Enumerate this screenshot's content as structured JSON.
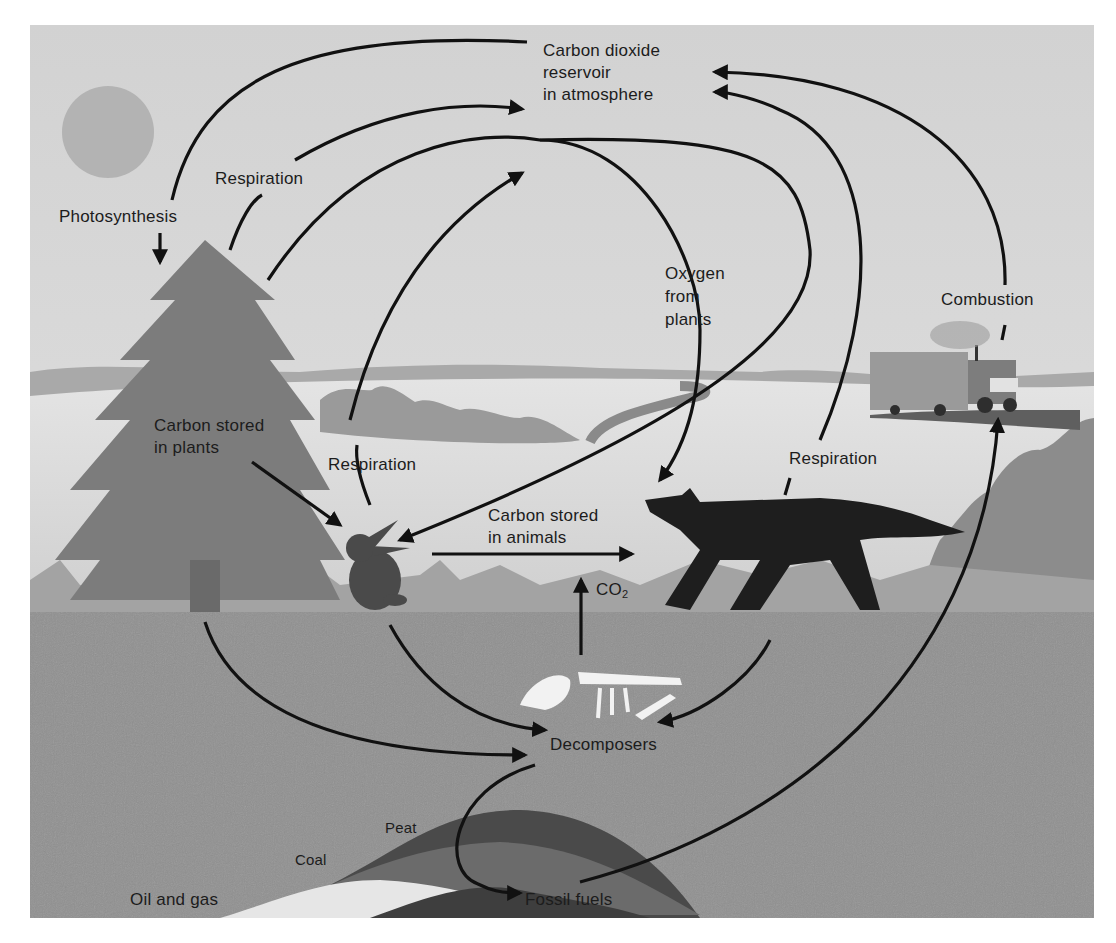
{
  "colors": {
    "sky": "#d6d6d6",
    "ground": "#8f8f8f",
    "arrow": "#111111",
    "tree": "#7a7a7a",
    "wolf": "#1e1e1e",
    "rabbit": "#4a4a4a",
    "sun": "#b3b3b3"
  },
  "labels": {
    "reservoir": "Carbon dioxide\nreservoir\nin atmosphere",
    "photosynthesis": "Photosynthesis",
    "respiration_plants": "Respiration",
    "respiration_rabbit": "Respiration",
    "respiration_wolf": "Respiration",
    "oxygen": "Oxygen\nfrom\nplants",
    "combustion": "Combustion",
    "carbon_plants": "Carbon stored\nin plants",
    "carbon_animals": "Carbon stored\nin animals",
    "co2_main": "CO",
    "co2_sub": "2",
    "decomposers": "Decomposers",
    "peat": "Peat",
    "coal": "Coal",
    "oil_gas": "Oil and gas",
    "fossil_fuels": "Fossil fuels"
  },
  "flows": [
    {
      "from": "reservoir",
      "to": "plants",
      "label": "Photosynthesis"
    },
    {
      "from": "plants",
      "to": "reservoir",
      "label": "Respiration"
    },
    {
      "from": "plants",
      "to": "wolf",
      "label": "Oxygen from plants"
    },
    {
      "from": "rabbit",
      "to": "reservoir",
      "label": "Respiration"
    },
    {
      "from": "wolf",
      "to": "reservoir",
      "label": "Respiration"
    },
    {
      "from": "truck",
      "to": "reservoir",
      "label": "Combustion"
    },
    {
      "from": "plants",
      "to": "rabbit",
      "label": ""
    },
    {
      "from": "rabbit",
      "to": "wolf",
      "label": "Carbon stored in animals"
    },
    {
      "from": "decomposers",
      "to": "animals",
      "label": "CO2"
    },
    {
      "from": "plants",
      "to": "decomposers",
      "label": ""
    },
    {
      "from": "rabbit",
      "to": "decomposers",
      "label": ""
    },
    {
      "from": "wolf",
      "to": "decomposers",
      "label": ""
    },
    {
      "from": "decomposers",
      "to": "fossil_fuels",
      "label": ""
    },
    {
      "from": "fossil_fuels",
      "to": "truck",
      "label": ""
    }
  ]
}
